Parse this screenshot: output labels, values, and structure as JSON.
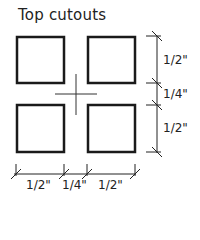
{
  "title": "Top cutouts",
  "diagram": {
    "squares": [
      {
        "id": "top-left",
        "x": 16,
        "y": 36,
        "w": 48,
        "h": 47
      },
      {
        "id": "top-right",
        "x": 87,
        "y": 36,
        "w": 48,
        "h": 47
      },
      {
        "id": "bottom-left",
        "x": 16,
        "y": 104,
        "w": 48,
        "h": 48
      },
      {
        "id": "bottom-right",
        "x": 87,
        "y": 104,
        "w": 48,
        "h": 48
      }
    ],
    "center_mark": "crosshair",
    "stroke_color": "#1a1a1a"
  },
  "dimensions": {
    "vertical": [
      "1/2\"",
      "1/4\"",
      "1/2\""
    ],
    "horizontal": [
      "1/2\"",
      "1/4\"",
      "1/2\""
    ]
  }
}
